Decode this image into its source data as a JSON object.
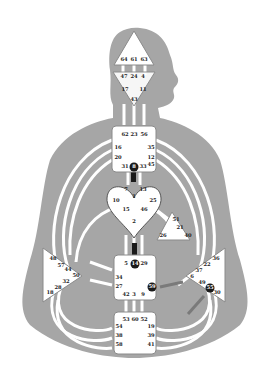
{
  "chart_type": "Human Design Bodygraph",
  "colors": {
    "background": "#ffffff",
    "body": "#a6a6a6",
    "channel": "#ffffff",
    "center_fill": "#ffffff",
    "center_stroke": "#8a8a8a",
    "active_gate": "#1a1a1a",
    "defined_channel": "#1a1a1a",
    "partial_channel": "#7a7a7a"
  },
  "centers": {
    "head": {
      "name": "Head",
      "gates": [
        "64",
        "61",
        "63"
      ]
    },
    "ajna": {
      "name": "Ajna",
      "gates": [
        "47",
        "24",
        "4",
        "17",
        "11",
        "43"
      ]
    },
    "throat": {
      "name": "Throat",
      "gates": [
        "62",
        "23",
        "56",
        "16",
        "35",
        "20",
        "12",
        "31",
        "8",
        "33",
        "45"
      ],
      "active": [
        "8"
      ]
    },
    "g": {
      "name": "G Center",
      "gates": [
        "7",
        "1",
        "13",
        "10",
        "25",
        "15",
        "46",
        "2"
      ]
    },
    "heart": {
      "name": "Heart/Ego",
      "gates": [
        "51",
        "21",
        "26",
        "40"
      ]
    },
    "sacral": {
      "name": "Sacral",
      "gates": [
        "5",
        "14",
        "29",
        "34",
        "27",
        "59",
        "42",
        "3",
        "9"
      ],
      "active": [
        "14",
        "59"
      ]
    },
    "spleen": {
      "name": "Spleen",
      "gates": [
        "48",
        "57",
        "44",
        "50",
        "32",
        "28",
        "18"
      ]
    },
    "solar_plexus": {
      "name": "Solar Plexus",
      "gates": [
        "36",
        "22",
        "37",
        "6",
        "49",
        "55",
        "30"
      ],
      "active": [
        "55"
      ]
    },
    "root": {
      "name": "Root",
      "gates": [
        "53",
        "60",
        "52",
        "54",
        "38",
        "58",
        "19",
        "39",
        "41"
      ]
    }
  }
}
